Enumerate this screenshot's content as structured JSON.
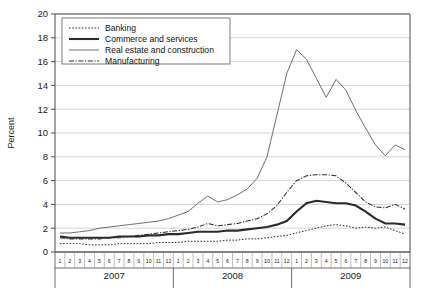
{
  "chart_data": {
    "type": "line",
    "title": "",
    "xlabel": "",
    "ylabel": "Percent",
    "ylim": [
      0,
      20
    ],
    "yticks": [
      0,
      2,
      4,
      6,
      8,
      10,
      12,
      14,
      16,
      18,
      20
    ],
    "grid": true,
    "legend_position": "top-left",
    "month_labels": [
      "1",
      "2",
      "3",
      "4",
      "5",
      "6",
      "7",
      "8",
      "9",
      "10",
      "11",
      "12"
    ],
    "year_groups": [
      "2007",
      "2008",
      "2009"
    ],
    "x": [
      "2007-1",
      "2007-2",
      "2007-3",
      "2007-4",
      "2007-5",
      "2007-6",
      "2007-7",
      "2007-8",
      "2007-9",
      "2007-10",
      "2007-11",
      "2007-12",
      "2008-1",
      "2008-2",
      "2008-3",
      "2008-4",
      "2008-5",
      "2008-6",
      "2008-7",
      "2008-8",
      "2008-9",
      "2008-10",
      "2008-11",
      "2008-12",
      "2009-1",
      "2009-2",
      "2009-3",
      "2009-4",
      "2009-5",
      "2009-6",
      "2009-7",
      "2009-8",
      "2009-9",
      "2009-10",
      "2009-11",
      "2009-12"
    ],
    "series": [
      {
        "name": "Banking",
        "style": "dotted",
        "values": [
          0.7,
          0.7,
          0.7,
          0.6,
          0.6,
          0.6,
          0.7,
          0.7,
          0.7,
          0.7,
          0.8,
          0.8,
          0.8,
          0.9,
          0.9,
          0.9,
          0.9,
          1.0,
          1.0,
          1.1,
          1.1,
          1.2,
          1.3,
          1.4,
          1.6,
          1.8,
          2.0,
          2.2,
          2.3,
          2.2,
          2.0,
          2.1,
          2.0,
          2.1,
          1.8,
          1.5
        ]
      },
      {
        "name": "Commerce and services",
        "style": "thick-solid",
        "values": [
          1.3,
          1.2,
          1.2,
          1.2,
          1.2,
          1.2,
          1.3,
          1.3,
          1.3,
          1.4,
          1.4,
          1.5,
          1.5,
          1.6,
          1.7,
          1.7,
          1.7,
          1.8,
          1.8,
          1.9,
          2.0,
          2.1,
          2.3,
          2.6,
          3.4,
          4.1,
          4.3,
          4.2,
          4.1,
          4.1,
          3.9,
          3.4,
          2.8,
          2.4,
          2.4,
          2.3
        ]
      },
      {
        "name": "Real estate and construction",
        "style": "thin-solid",
        "values": [
          1.6,
          1.6,
          1.7,
          1.8,
          2.0,
          2.1,
          2.2,
          2.3,
          2.4,
          2.5,
          2.6,
          2.8,
          3.1,
          3.4,
          4.1,
          4.7,
          4.2,
          4.4,
          4.8,
          5.3,
          6.2,
          8.0,
          11.5,
          15.0,
          17.0,
          16.2,
          14.6,
          13.0,
          14.5,
          13.6,
          11.9,
          10.4,
          9.0,
          8.1,
          9.0,
          8.6
        ]
      },
      {
        "name": "Manufacturing",
        "style": "dash-dot",
        "values": [
          1.2,
          1.1,
          1.1,
          1.1,
          1.1,
          1.2,
          1.2,
          1.3,
          1.4,
          1.5,
          1.6,
          1.7,
          1.8,
          1.9,
          2.1,
          2.4,
          2.2,
          2.3,
          2.4,
          2.6,
          2.8,
          3.2,
          3.9,
          5.0,
          6.0,
          6.4,
          6.5,
          6.5,
          6.4,
          5.8,
          5.0,
          4.2,
          3.8,
          3.7,
          4.0,
          3.6
        ]
      }
    ]
  },
  "legend": {
    "items": [
      {
        "label": "Banking"
      },
      {
        "label": "Commerce and services"
      },
      {
        "label": "Real estate and construction"
      },
      {
        "label": "Manufacturing"
      }
    ]
  },
  "axes": {
    "y_title": "Percent"
  }
}
